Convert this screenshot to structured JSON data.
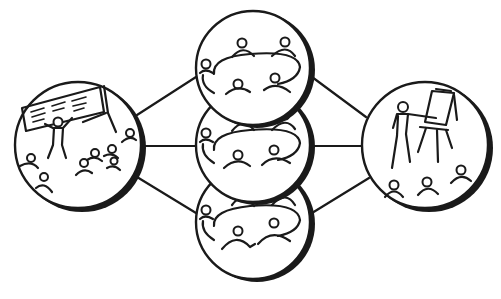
{
  "diagram": {
    "description": "Workshop format diagram: plenary presentation branching into three parallel table discussion groups, converging into a flipchart presentation",
    "colors": {
      "stroke": "#1a1a1a",
      "background": "#ffffff"
    },
    "nodes": [
      {
        "id": "plenary",
        "label": "Presenter at screen with audience",
        "icon": "presentation-screen-icon"
      },
      {
        "id": "group-1",
        "label": "Round table discussion group",
        "icon": "round-table-icon"
      },
      {
        "id": "group-2",
        "label": "Round table discussion group",
        "icon": "round-table-icon"
      },
      {
        "id": "group-3",
        "label": "Round table discussion group",
        "icon": "round-table-icon"
      },
      {
        "id": "report-back",
        "label": "Presenter at flipchart with audience",
        "icon": "flipchart-icon"
      }
    ],
    "edges": [
      [
        "plenary",
        "group-1"
      ],
      [
        "plenary",
        "group-2"
      ],
      [
        "plenary",
        "group-3"
      ],
      [
        "group-1",
        "report-back"
      ],
      [
        "group-2",
        "report-back"
      ],
      [
        "group-3",
        "report-back"
      ]
    ]
  }
}
